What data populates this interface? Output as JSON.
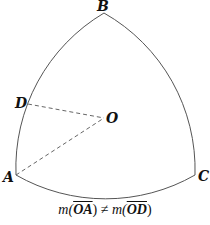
{
  "diagram": {
    "type": "reuleaux-triangle",
    "points": {
      "A": {
        "label": "A",
        "x": 16,
        "y": 175
      },
      "B": {
        "label": "B",
        "x": 104,
        "y": 13
      },
      "C": {
        "label": "C",
        "x": 195,
        "y": 175
      },
      "D": {
        "label": "D",
        "x": 28,
        "y": 104
      },
      "O": {
        "label": "O",
        "x": 104,
        "y": 118
      }
    },
    "segments_dashed": [
      "OD",
      "OA"
    ],
    "caption": {
      "m1": "m(",
      "seg1": "OA",
      "close1": ")",
      "neq": " ≠ ",
      "m2": "m(",
      "seg2": "OD",
      "close2": ")"
    }
  }
}
